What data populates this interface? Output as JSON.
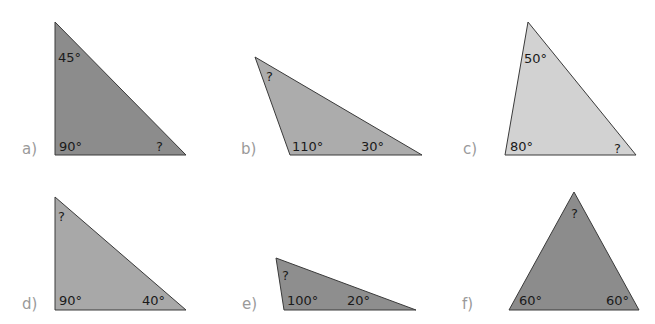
{
  "triangles": [
    {
      "id": "a",
      "label": "a)",
      "fill": "#8c8c8c",
      "points": "55,22 55,155 186,155",
      "label_pos": [
        22,
        154
      ],
      "angles": [
        {
          "text": "45°",
          "x": 58,
          "y": 62
        },
        {
          "text": "90°",
          "x": 59,
          "y": 151
        },
        {
          "text": "?",
          "x": 156,
          "y": 151
        }
      ]
    },
    {
      "id": "b",
      "label": "b)",
      "fill": "#acacac",
      "points": "255,57 290,155 422,155",
      "label_pos": [
        241,
        154
      ],
      "angles": [
        {
          "text": "?",
          "x": 266,
          "y": 81
        },
        {
          "text": "110°",
          "x": 292,
          "y": 151
        },
        {
          "text": "30°",
          "x": 361,
          "y": 151
        }
      ]
    },
    {
      "id": "c",
      "label": "c)",
      "fill": "#d2d2d2",
      "points": "528,22 505,155 636,155",
      "label_pos": [
        463,
        154
      ],
      "angles": [
        {
          "text": "50°",
          "x": 524,
          "y": 63
        },
        {
          "text": "80°",
          "x": 510,
          "y": 151
        },
        {
          "text": "?",
          "x": 614,
          "y": 153
        }
      ]
    },
    {
      "id": "d",
      "label": "d)",
      "fill": "#a8a8a8",
      "points": "55,197 55,310 186,310",
      "label_pos": [
        22,
        309
      ],
      "angles": [
        {
          "text": "?",
          "x": 58,
          "y": 221
        },
        {
          "text": "90°",
          "x": 59,
          "y": 305
        },
        {
          "text": "40°",
          "x": 142,
          "y": 305
        }
      ]
    },
    {
      "id": "e",
      "label": "e)",
      "fill": "#8e8e8e",
      "points": "276,258 284,310 416,310",
      "label_pos": [
        242,
        309
      ],
      "angles": [
        {
          "text": "?",
          "x": 282,
          "y": 280
        },
        {
          "text": "100°",
          "x": 287,
          "y": 305
        },
        {
          "text": "20°",
          "x": 347,
          "y": 305
        }
      ]
    },
    {
      "id": "f",
      "label": "f)",
      "fill": "#8c8c8c",
      "points": "574,192 509,310 639,310",
      "label_pos": [
        462,
        309
      ],
      "angles": [
        {
          "text": "?",
          "x": 571,
          "y": 218
        },
        {
          "text": "60°",
          "x": 519,
          "y": 305
        },
        {
          "text": "60°",
          "x": 606,
          "y": 305
        }
      ]
    }
  ]
}
